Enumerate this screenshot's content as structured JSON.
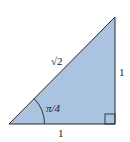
{
  "diagram": {
    "type": "right-triangle",
    "fill_color": "#a9c3e0",
    "stroke_color": "#2a2a2a",
    "labels": {
      "hypotenuse": "√2",
      "vertical_side": "1",
      "horizontal_side": "1",
      "angle": "π/4"
    },
    "right_angle_marker": true
  }
}
